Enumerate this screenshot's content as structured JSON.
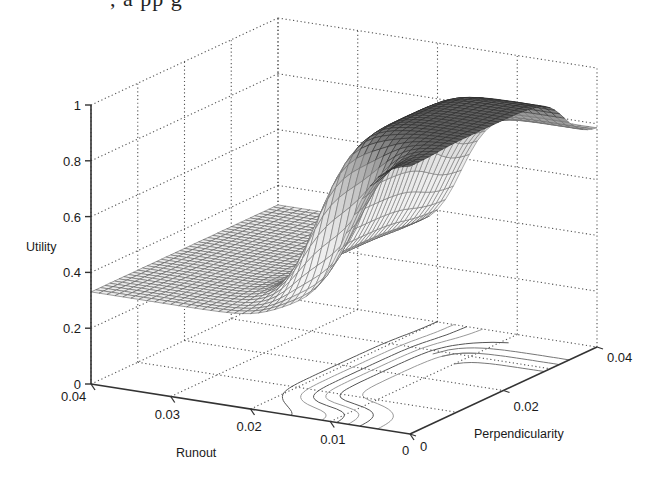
{
  "header": {
    "clipped_text": ", a  pp  g"
  },
  "chart_data": {
    "type": "surface3d",
    "title": "",
    "zlabel": "Utility",
    "xlabel": "Runout",
    "ylabel": "Perpendicularity",
    "x_ticks": [
      "0.04",
      "0.03",
      "0.02",
      "0.01",
      "0"
    ],
    "x_tick_values": [
      0.04,
      0.03,
      0.02,
      0.01,
      0
    ],
    "y_ticks": [
      "0",
      "0.02",
      "0.04"
    ],
    "y_tick_values": [
      0,
      0.02,
      0.04
    ],
    "z_ticks": [
      "0",
      "0.2",
      "0.4",
      "0.6",
      "0.8",
      "1"
    ],
    "z_tick_values": [
      0,
      0.2,
      0.4,
      0.6,
      0.8,
      1
    ],
    "xlim": [
      0,
      0.04
    ],
    "ylim": [
      0,
      0.04
    ],
    "zlim": [
      0,
      1
    ],
    "grid": true,
    "contour_on_floor": true,
    "surface_description": "Utility ~0.33 at large Runout; rises steeply (sigmoid) to ~0.97 plateau for small Runout and moderate Perpendicularity; drops to ~0.78 at large Perpendicularity near Runout 0",
    "model": {
      "base": 0.33,
      "high": 0.97,
      "right_level": 0.78,
      "runout_threshold": 0.017,
      "runout_steepness": 550,
      "perp_threshold": 0.033,
      "perp_steepness": 500,
      "perp_low_threshold": 0.006,
      "perp_low_steepness": 600
    },
    "grid_resolution": 40
  },
  "colors": {
    "mesh_dark": "#222222",
    "mesh_light": "#bbbbbb",
    "axis": "#333333",
    "grid": "#555555"
  }
}
